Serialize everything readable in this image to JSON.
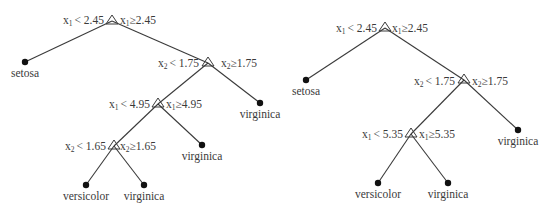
{
  "trees": [
    {
      "name": "left-tree",
      "nodes": [
        {
          "id": "n1",
          "x": 112,
          "y": 21,
          "left": "< 2.45",
          "right": "≥2.45",
          "var": "1"
        },
        {
          "id": "n2",
          "x": 208,
          "y": 63,
          "left": "< 1.75",
          "right": "≥1.75",
          "var": "2"
        },
        {
          "id": "n3",
          "x": 158,
          "y": 104,
          "left": "< 4.95",
          "right": "≥4.95",
          "var": "1"
        },
        {
          "id": "n4",
          "x": 114,
          "y": 146,
          "left": "< 1.65",
          "right": "≥1.65",
          "var": "2"
        }
      ],
      "leaves": [
        {
          "id": "l1",
          "x": 25,
          "y": 62,
          "label": "setosa"
        },
        {
          "id": "l2",
          "x": 260,
          "y": 103,
          "label": "virginica"
        },
        {
          "id": "l3",
          "x": 202,
          "y": 145,
          "label": "virginica"
        },
        {
          "id": "l4",
          "x": 86,
          "y": 185,
          "label": "versicolor"
        },
        {
          "id": "l5",
          "x": 144,
          "y": 185,
          "label": "virginica"
        }
      ]
    },
    {
      "name": "right-tree",
      "nodes": [
        {
          "id": "m1",
          "x": 385,
          "y": 28,
          "left": "< 2.45",
          "right": "≥2.45",
          "var": "1"
        },
        {
          "id": "m2",
          "x": 464,
          "y": 80,
          "left": "< 1.75",
          "right": "≥1.75",
          "var": "2"
        },
        {
          "id": "m3",
          "x": 411,
          "y": 134,
          "left": "< 5.35",
          "right": "≥5.35",
          "var": "1"
        }
      ],
      "leaves": [
        {
          "id": "k1",
          "x": 306,
          "y": 80,
          "label": "setosa"
        },
        {
          "id": "k2",
          "x": 518,
          "y": 130,
          "label": "virginica"
        },
        {
          "id": "k3",
          "x": 378,
          "y": 183,
          "label": "versicolor"
        },
        {
          "id": "k4",
          "x": 448,
          "y": 183,
          "label": "virginica"
        }
      ]
    }
  ],
  "labels": {
    "var_prefix": "x",
    "t1": {
      "n1_l": "< 2.45",
      "n1_r": "≥2.45",
      "n2_l": "< 1.75",
      "n2_r": "≥1.75",
      "n3_l": "< 4.95",
      "n3_r": "≥4.95",
      "n4_l": "< 1.65",
      "n4_r": "≥1.65",
      "leaf_setosa": "setosa",
      "leaf_virginica_1": "virginica",
      "leaf_virginica_2": "virginica",
      "leaf_versicolor": "versicolor",
      "leaf_virginica_3": "virginica"
    },
    "t2": {
      "m1_l": "< 2.45",
      "m1_r": "≥2.45",
      "m2_l": "< 1.75",
      "m2_r": "≥1.75",
      "m3_l": "< 5.35",
      "m3_r": "≥5.35",
      "leaf_setosa": "setosa",
      "leaf_virginica_1": "virginica",
      "leaf_versicolor": "versicolor",
      "leaf_virginica_2": "virginica"
    },
    "subs": {
      "one": "1",
      "two": "2"
    }
  }
}
